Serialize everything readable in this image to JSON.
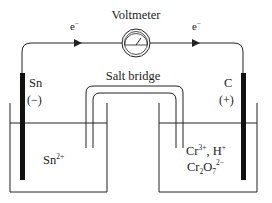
{
  "labels": {
    "voltmeter": "Voltmeter",
    "salt_bridge": "Salt bridge",
    "electron_left": "e",
    "electron_right": "e",
    "electron_sup": "−",
    "anode_name": "Sn",
    "anode_sign": "(−)",
    "cathode_name": "C",
    "cathode_sign": "(+)",
    "left_solution": {
      "base": "Sn",
      "sup": "2+"
    },
    "right_solution_line1": {
      "a": "Cr",
      "a_sup": "3+",
      "sep": ", H",
      "b_sup": "+"
    },
    "right_solution_line2": {
      "a": "Cr",
      "a_sub": "2",
      "b": "O",
      "b_sub": "7",
      "sup": "2−"
    }
  },
  "colors": {
    "stroke": "#222222",
    "electrode": "#111111",
    "background": "#ffffff"
  }
}
